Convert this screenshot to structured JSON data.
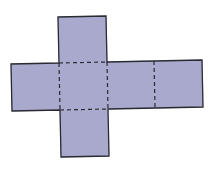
{
  "diagram": {
    "type": "cube-net",
    "colors": {
      "background": "#ffffff",
      "face_fill": "#a9a9cd",
      "outline": "#2a2a33",
      "fold_line": "#2a2a33"
    },
    "faces": [
      {
        "name": "top",
        "points": "58,17 106,16 107,62 59,63"
      },
      {
        "name": "left",
        "points": "11,64 59,63 60,110 12,111"
      },
      {
        "name": "center",
        "points": "59,63 107,62 108,109 60,110"
      },
      {
        "name": "right-1",
        "points": "107,62 154,61 155,108 108,109"
      },
      {
        "name": "right-2",
        "points": "154,61 202,60 203,107 155,108"
      },
      {
        "name": "bottom",
        "points": "60,110 108,109 109,156 61,157"
      }
    ],
    "outline_points": "58,17 106,16 107,62 202,60 203,107 108,109 109,156 61,157 60,110 12,111 11,64 59,63",
    "fold_lines": [
      {
        "name": "top-center",
        "x1": 59,
        "y1": 63,
        "x2": 107,
        "y2": 62
      },
      {
        "name": "left-center",
        "x1": 59,
        "y1": 63,
        "x2": 60,
        "y2": 110
      },
      {
        "name": "center-right",
        "x1": 107,
        "y1": 62,
        "x2": 108,
        "y2": 109
      },
      {
        "name": "center-bottom",
        "x1": 60,
        "y1": 110,
        "x2": 108,
        "y2": 109
      },
      {
        "name": "right-right",
        "x1": 154,
        "y1": 61,
        "x2": 155,
        "y2": 108
      }
    ]
  }
}
